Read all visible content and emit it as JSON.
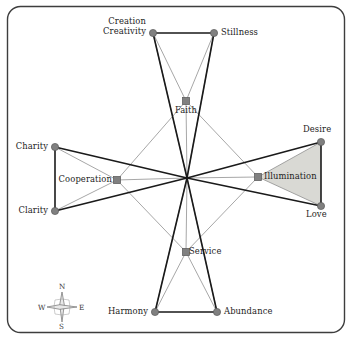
{
  "figure": {
    "type": "network-diagram",
    "frame": {
      "shape": "rounded-rectangle",
      "border_color": "#3d3d3d",
      "background_color": "#ffffff"
    },
    "style": {
      "node_color": "#808080",
      "node_edge_color": "#5a5a5a",
      "thick_line_color": "#1a1a1a",
      "thin_line_color": "#8a8a8a",
      "shaded_region_fill": "#d9d9d4",
      "text_color": "#1c1c1c"
    },
    "center_point": {
      "x": 187,
      "y": 178,
      "marked": "false"
    },
    "nodes": [
      {
        "id": "creation",
        "label": "Creation\nCreativity",
        "label_lines": [
          "Creation",
          "Creativity"
        ],
        "x": 153,
        "y": 33,
        "ring": "outer",
        "label_pos": "left"
      },
      {
        "id": "stillness",
        "label": "Stillness",
        "label_lines": [
          "Stillness"
        ],
        "x": 214,
        "y": 33,
        "ring": "outer",
        "label_pos": "right"
      },
      {
        "id": "desire",
        "label": "Desire",
        "label_lines": [
          "Desire"
        ],
        "x": 321,
        "y": 142,
        "ring": "outer",
        "label_pos": "above-right"
      },
      {
        "id": "love",
        "label": "Love",
        "label_lines": [
          "Love"
        ],
        "x": 321,
        "y": 206,
        "ring": "outer",
        "label_pos": "below-right"
      },
      {
        "id": "abundance",
        "label": "Abundance",
        "label_lines": [
          "Abundance"
        ],
        "x": 217,
        "y": 312,
        "ring": "outer",
        "label_pos": "right"
      },
      {
        "id": "harmony",
        "label": "Harmony",
        "label_lines": [
          "Harmony"
        ],
        "x": 155,
        "y": 312,
        "ring": "outer",
        "label_pos": "left"
      },
      {
        "id": "clarity",
        "label": "Clarity",
        "label_lines": [
          "Clarity"
        ],
        "x": 55,
        "y": 211,
        "ring": "outer",
        "label_pos": "left"
      },
      {
        "id": "charity",
        "label": "Charity",
        "label_lines": [
          "Charity"
        ],
        "x": 55,
        "y": 147,
        "ring": "outer",
        "label_pos": "left"
      },
      {
        "id": "faith",
        "label": "Faith",
        "label_lines": [
          "Faith"
        ],
        "x": 186,
        "y": 101,
        "ring": "inner",
        "label_pos": "below"
      },
      {
        "id": "illumination",
        "label": "Illumination",
        "label_lines": [
          "Illumination"
        ],
        "x": 258,
        "y": 177,
        "ring": "inner",
        "label_pos": "right"
      },
      {
        "id": "service",
        "label": "Service",
        "label_lines": [
          "Service"
        ],
        "x": 186,
        "y": 252,
        "ring": "inner",
        "label_pos": "right"
      },
      {
        "id": "cooperation",
        "label": "Cooperation",
        "label_lines": [
          "Cooperation"
        ],
        "x": 117,
        "y": 180,
        "ring": "inner",
        "label_pos": "left"
      }
    ],
    "shaded_regions": [
      {
        "id": "desire-illumination-love",
        "vertices": [
          "desire",
          "love",
          "illumination"
        ]
      }
    ],
    "compass": {
      "center": {
        "x": 62,
        "y": 307
      },
      "north_label": "N",
      "east_label": "E",
      "south_label": "S",
      "west_label": "W"
    }
  }
}
